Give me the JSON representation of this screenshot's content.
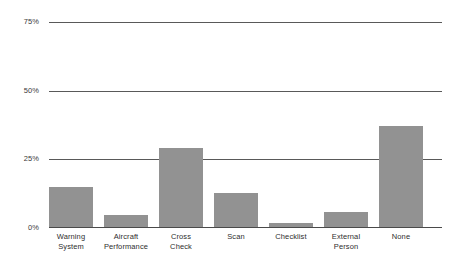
{
  "chart_data": {
    "type": "bar",
    "title": "",
    "subtitle": "",
    "xlabel": "",
    "ylabel": "",
    "categories": [
      "Warning System",
      "Aircraft Performance",
      "Cross Check",
      "Scan",
      "Checklist",
      "External Person",
      "None"
    ],
    "category_lines": [
      [
        "Warning",
        "System"
      ],
      [
        "Aircraft",
        "Performance"
      ],
      [
        "Cross",
        "Check"
      ],
      [
        "Scan",
        ""
      ],
      [
        "Checklist",
        ""
      ],
      [
        "External",
        "Person"
      ],
      [
        "None",
        ""
      ]
    ],
    "values": [
      14.5,
      4.5,
      29,
      12.5,
      1.5,
      5.5,
      37
    ],
    "ylim": [
      0,
      75
    ],
    "ytick_values": [
      0,
      25,
      50,
      75
    ],
    "ytick_labels": [
      "0%",
      "25%",
      "50%",
      "75%"
    ],
    "grid": true,
    "legend": false,
    "legend_position": "none",
    "bar_color": "#929292",
    "gridline_color": "#595959",
    "axis_text_color": "#2e2e2e",
    "background_color": "#ffffff"
  }
}
